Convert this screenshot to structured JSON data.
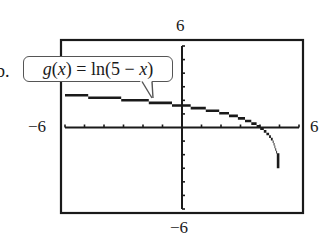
{
  "part_marker": "b.",
  "chart_data": {
    "type": "line",
    "title": "",
    "function_label": "g(x) = ln(5 − x)",
    "function_label_parts": {
      "name": "g",
      "var_open": "(",
      "var": "x",
      "var_close": ")",
      "eq": " = ln(5 − ",
      "var2": "x",
      "close": ")"
    },
    "xlabel": "",
    "ylabel": "",
    "window": {
      "xmin": -6,
      "xmax": 6,
      "ymin": -6,
      "ymax": 6,
      "xscl": 1,
      "yscl": 1
    },
    "tick_labels": {
      "top": "6",
      "bottom": "−6",
      "left": "−6",
      "right": "6"
    },
    "xlim": [
      -6,
      6
    ],
    "ylim": [
      -6,
      6
    ],
    "grid": false,
    "legend": "callout bubble top-left pointing to curve",
    "series": [
      {
        "name": "g(x) = ln(5 − x)",
        "x": [
          -6,
          -5,
          -4,
          -3,
          -2,
          -1,
          0,
          1,
          2,
          3,
          4,
          4.5,
          4.8,
          4.9,
          4.95
        ],
        "values": [
          2.4,
          2.3,
          2.2,
          2.08,
          1.95,
          1.79,
          1.61,
          1.39,
          1.1,
          0.69,
          0.0,
          -0.69,
          -1.61,
          -2.3,
          -3.0
        ]
      }
    ],
    "asymptote": {
      "x": 5,
      "drawn": false
    },
    "x_intercept": 4,
    "y_intercept": 1.61
  }
}
